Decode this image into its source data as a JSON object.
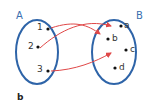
{
  "diagram": {
    "set_a": {
      "label": "A",
      "elements": [
        "1",
        "2",
        "3"
      ]
    },
    "set_b": {
      "label": "B",
      "elements": [
        "a",
        "b",
        "c",
        "d"
      ]
    },
    "mappings": [
      {
        "from": "1",
        "to": "b"
      },
      {
        "from": "2",
        "to": "a"
      },
      {
        "from": "3",
        "to": "c"
      }
    ],
    "caption": "b",
    "colors": {
      "ellipse": "#2e64a8",
      "arrow": "#e04848",
      "dot": "#111111"
    }
  }
}
